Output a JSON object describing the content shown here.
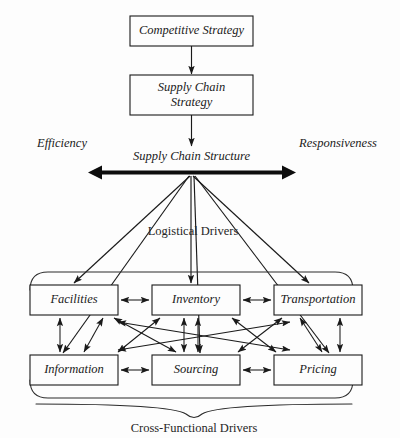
{
  "diagram": {
    "background_color": "#fdfdfd",
    "line_color": "#1a1a1a",
    "strategy_boxes": [
      {
        "id": "competitive-strategy",
        "label": "Competitive Strategy",
        "lines": [
          "Competitive Strategy"
        ]
      },
      {
        "id": "supply-chain-strategy",
        "label": "Supply Chain Strategy",
        "lines": [
          "Supply Chain",
          "Strategy"
        ]
      }
    ],
    "spectrum": {
      "left_label": "Efficiency",
      "right_label": "Responsiveness",
      "center_label": "Supply Chain Structure"
    },
    "group_labels": {
      "logistical": "Logistical Drivers",
      "cross_functional": "Cross-Functional Drivers"
    },
    "drivers": {
      "logistical_row": [
        {
          "id": "facilities",
          "label": "Facilities"
        },
        {
          "id": "inventory",
          "label": "Inventory"
        },
        {
          "id": "transportation",
          "label": "Transportation"
        }
      ],
      "cross_functional_row": [
        {
          "id": "information",
          "label": "Information"
        },
        {
          "id": "sourcing",
          "label": "Sourcing"
        },
        {
          "id": "pricing",
          "label": "Pricing"
        }
      ]
    }
  }
}
